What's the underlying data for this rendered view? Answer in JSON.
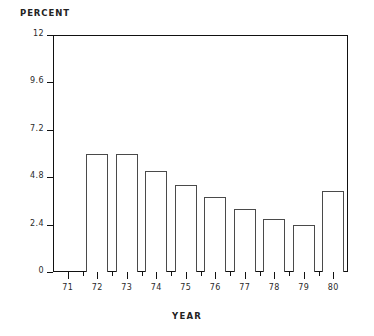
{
  "chart_data": {
    "type": "bar",
    "title": "",
    "xlabel": "YEAR",
    "ylabel": "PERCENT",
    "categories": [
      "71",
      "72",
      "73",
      "74",
      "75",
      "76",
      "77",
      "78",
      "79",
      "80"
    ],
    "values": [
      null,
      6.0,
      6.0,
      5.1,
      4.4,
      3.8,
      3.2,
      2.7,
      2.4,
      4.1
    ],
    "ylim": [
      0,
      12
    ],
    "xlim_labels": [
      "71",
      "80"
    ],
    "ytick_labels": [
      "0",
      "2.4",
      "4.8",
      "7.2",
      "9.6",
      "12"
    ],
    "ytick_values": [
      0,
      2.4,
      4.8,
      7.2,
      9.6,
      12
    ],
    "grid": false,
    "legend": false,
    "bar_style": "outlined-white",
    "colors": {
      "axis": "#111111",
      "bar_edge": "#4a4a4a",
      "bar_fill": "#ffffff",
      "text": "#2a2a2a",
      "background": "#ffffff"
    }
  },
  "labels": {
    "ylabel": "PERCENT",
    "xlabel": "YEAR"
  }
}
